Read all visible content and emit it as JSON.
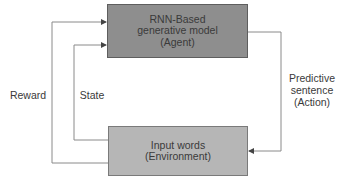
{
  "diagram": {
    "title": "",
    "nodes": [
      {
        "id": "agent",
        "lines": [
          "RNN-Based",
          "generative model",
          "(Agent)"
        ],
        "fill": "#8e8e8e"
      },
      {
        "id": "environment",
        "lines": [
          "Input words",
          "(Environment)"
        ],
        "fill": "#b6b6b6"
      }
    ],
    "edges": [
      {
        "from": "agent",
        "to": "environment",
        "label_lines": [
          "Predictive",
          "sentence",
          "(Action)"
        ]
      },
      {
        "from": "environment",
        "to": "agent",
        "label": "State"
      },
      {
        "from": "environment",
        "to": "agent",
        "label": "Reward"
      }
    ],
    "colors": {
      "line": "#8a8a8a",
      "text": "#3a3a3a"
    }
  }
}
